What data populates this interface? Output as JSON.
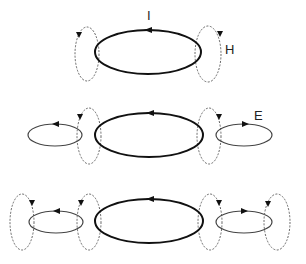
{
  "figure": {
    "labels": {
      "current": "I",
      "magnetic": "H",
      "electric": "E"
    },
    "colors": {
      "main_loop": "#111111",
      "h_loop": "#666666",
      "e_loop": "#444444",
      "background": "#ffffff"
    },
    "rows": [
      {
        "name": "row-1",
        "main": {
          "cx": 148,
          "cy": 52
        },
        "h_loops": [
          87,
          208
        ],
        "e_loops": [],
        "outer_h": []
      },
      {
        "name": "row-2",
        "main": {
          "cx": 149,
          "cy": 135
        },
        "h_loops": [
          89,
          209
        ],
        "e_loops": [
          55,
          244
        ],
        "outer_h": []
      },
      {
        "name": "row-3",
        "main": {
          "cx": 149,
          "cy": 221
        },
        "h_loops": [
          89,
          210
        ],
        "e_loops": [
          56,
          244
        ],
        "outer_h": [
          22,
          277
        ]
      }
    ]
  }
}
